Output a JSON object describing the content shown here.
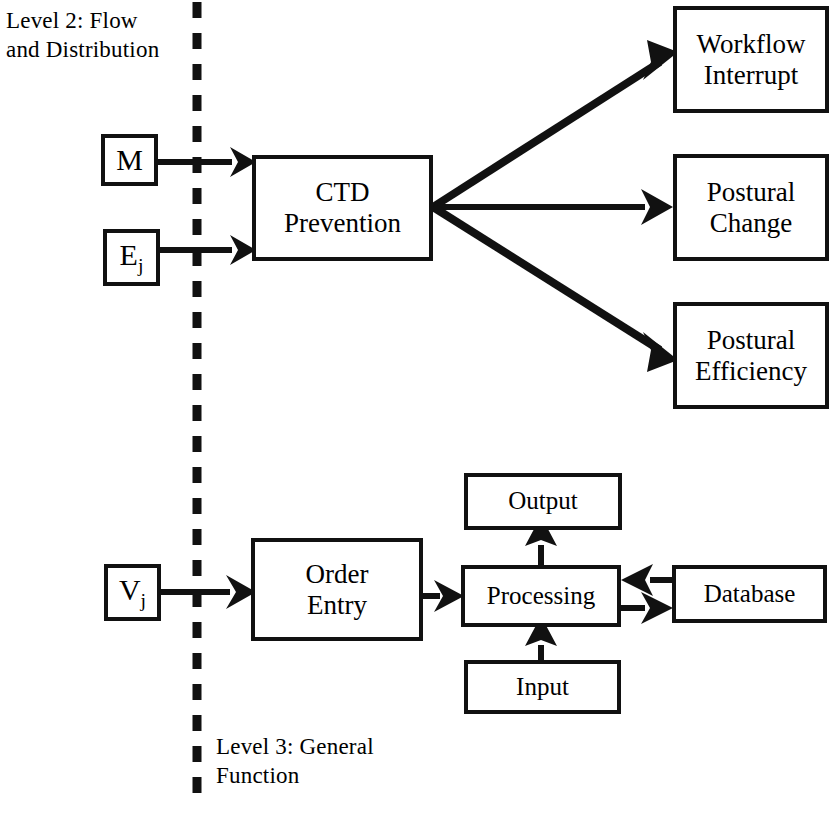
{
  "diagram": {
    "title_zone_upper": "Level 2:  Flow\nand Distribution",
    "title_zone_lower": "Level 3:  General\nFunction",
    "divider": {
      "style": "dashed-vertical",
      "x": 196
    },
    "ink_color": "#111111",
    "background_color": "#ffffff"
  },
  "nodes": {
    "m": {
      "label": "M",
      "sub": ""
    },
    "ej": {
      "label": "E",
      "sub": "j"
    },
    "vj": {
      "label": "V",
      "sub": "j"
    },
    "ctd": {
      "label": "CTD\nPrevention"
    },
    "workflow_interrupt": {
      "label": "Workflow\nInterrupt"
    },
    "postural_change": {
      "label": "Postural\nChange"
    },
    "postural_efficiency": {
      "label": "Postural\nEfficiency"
    },
    "order_entry": {
      "label": "Order\nEntry"
    },
    "output": {
      "label": "Output"
    },
    "processing": {
      "label": "Processing"
    },
    "input": {
      "label": "Input"
    },
    "database": {
      "label": "Database"
    }
  },
  "edges": [
    {
      "name": "m-to-ctd",
      "from": "m",
      "to": "ctd",
      "direction": "right"
    },
    {
      "name": "ej-to-ctd",
      "from": "ej",
      "to": "ctd",
      "direction": "right"
    },
    {
      "name": "ctd-to-workflow-interrupt",
      "from": "ctd",
      "to": "workflow_interrupt",
      "direction": "up-right"
    },
    {
      "name": "ctd-to-postural-change",
      "from": "ctd",
      "to": "postural_change",
      "direction": "right"
    },
    {
      "name": "ctd-to-postural-efficiency",
      "from": "ctd",
      "to": "postural_efficiency",
      "direction": "down-right"
    },
    {
      "name": "vj-to-order-entry",
      "from": "vj",
      "to": "order_entry",
      "direction": "right"
    },
    {
      "name": "order-entry-to-processing",
      "from": "order_entry",
      "to": "processing",
      "direction": "right"
    },
    {
      "name": "processing-to-output",
      "from": "processing",
      "to": "output",
      "direction": "up"
    },
    {
      "name": "input-to-processing",
      "from": "input",
      "to": "processing",
      "direction": "up"
    },
    {
      "name": "database-to-processing",
      "from": "database",
      "to": "processing",
      "direction": "left"
    },
    {
      "name": "processing-to-database",
      "from": "processing",
      "to": "database",
      "direction": "right"
    }
  ]
}
